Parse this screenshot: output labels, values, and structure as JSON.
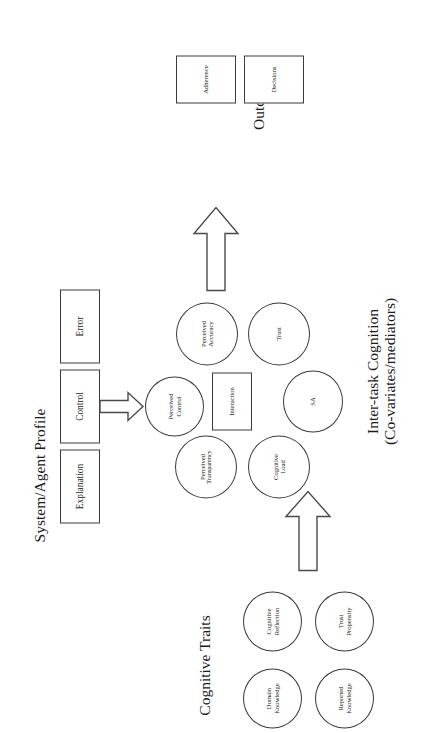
{
  "figure": {
    "orientation": "rotated-90-ccw",
    "stroke_color": "#3a3a3a",
    "background_color": "#ffffff"
  },
  "groups": {
    "cognitive_traits": {
      "label": "Cognitive Traits",
      "nodes": [
        {
          "label": "Domain\nKnowledge",
          "shape": "ellipse"
        },
        {
          "label": "Reported\nKnowledge",
          "shape": "ellipse"
        },
        {
          "label": "Cognitive\nReflection",
          "shape": "ellipse"
        },
        {
          "label": "Trust\nPropensity",
          "shape": "ellipse"
        }
      ]
    },
    "system_agent_profile": {
      "label": "System/Agent Profile",
      "nodes": [
        {
          "label": "Explanation",
          "shape": "rect"
        },
        {
          "label": "Control",
          "shape": "rect"
        },
        {
          "label": "Error",
          "shape": "rect"
        }
      ]
    },
    "inter_task_cognition": {
      "label_line1": "Inter-task Cognition",
      "label_line2": "(Co-variates/mediators)",
      "nodes": [
        {
          "label": "Perceived\nControl",
          "shape": "ellipse"
        },
        {
          "label": "Perceived\nAccuracy",
          "shape": "ellipse"
        },
        {
          "label": "Trust",
          "shape": "ellipse"
        },
        {
          "label": "SA",
          "shape": "ellipse"
        },
        {
          "label": "Cognitive\nLoad",
          "shape": "ellipse"
        },
        {
          "label": "Perceived\nTransparency",
          "shape": "ellipse"
        },
        {
          "label": "Interaction",
          "shape": "rect"
        }
      ]
    },
    "outcomes": {
      "label": "Outcomes",
      "nodes": [
        {
          "label": "Decisions",
          "shape": "rect"
        },
        {
          "label": "Adherence",
          "shape": "rect"
        }
      ]
    }
  },
  "arrows": [
    {
      "name": "traits-to-cognition",
      "direction": "right",
      "style": "block-outline"
    },
    {
      "name": "control-to-perceived-control",
      "direction": "right",
      "style": "block-outline"
    },
    {
      "name": "cognition-to-outcomes",
      "direction": "right",
      "style": "block-outline"
    }
  ],
  "labels": {
    "cognitive_traits": "Cognitive Traits",
    "system_agent_profile": "System/Agent Profile",
    "inter_task_line1": "Inter-task Cognition",
    "inter_task_line2": "(Co-variates/mediators)",
    "outcomes": "Outcomes",
    "domain_knowledge_l1": "Domain",
    "domain_knowledge_l2": "Knowledge",
    "reported_knowledge_l1": "Reported",
    "reported_knowledge_l2": "Knowledge",
    "cognitive_reflection_l1": "Cognitive",
    "cognitive_reflection_l2": "Reflection",
    "trust_propensity_l1": "Trust",
    "trust_propensity_l2": "Propensity",
    "explanation": "Explanation",
    "control": "Control",
    "error": "Error",
    "perceived_control_l1": "Perceived",
    "perceived_control_l2": "Control",
    "perceived_accuracy_l1": "Perceived",
    "perceived_accuracy_l2": "Accuracy",
    "trust": "Trust",
    "sa": "SA",
    "cognitive_load_l1": "Cognitive",
    "cognitive_load_l2": "Load",
    "perceived_transparency_l1": "Perceived",
    "perceived_transparency_l2": "Transparency",
    "interaction": "Interaction",
    "decisions": "Decisions",
    "adherence": "Adherence"
  }
}
